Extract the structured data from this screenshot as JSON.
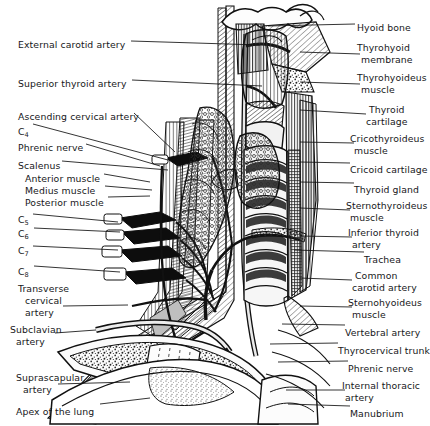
{
  "figure": {
    "style": "black-and-white engraved line art on white background",
    "background": "#ffffff",
    "ink": "#17171a"
  },
  "labels_left": [
    {
      "name": "external-carotid-artery",
      "text": "External carotid artery",
      "x": 18,
      "y": 39,
      "leader_to": [
        260,
        45
      ]
    },
    {
      "name": "superior-thyroid-artery",
      "text": "Superior thyroid artery",
      "x": 18,
      "y": 78,
      "leader_to": [
        262,
        86
      ]
    },
    {
      "name": "ascending-cervical-artery",
      "text": "Ascending cervical artery",
      "x": 18,
      "y": 111,
      "leader_to": [
        175,
        152
      ]
    },
    {
      "name": "c4-root",
      "text": "C",
      "sub": "4",
      "x": 18,
      "y": 126,
      "leader_to": [
        168,
        160
      ]
    },
    {
      "name": "phrenic-nerve-left",
      "text": "Phrenic nerve",
      "x": 18,
      "y": 142,
      "leader_to": [
        160,
        166
      ]
    },
    {
      "name": "scalenus",
      "text": "Scalenus",
      "x": 18,
      "y": 160,
      "leader_to": [
        168,
        170
      ]
    },
    {
      "name": "scalenus-anterior-muscle",
      "text": "Anterior muscle",
      "x": 25,
      "y": 173,
      "leader_to": [
        150,
        182
      ]
    },
    {
      "name": "scalenus-medius-muscle",
      "text": "Medius muscle",
      "x": 25,
      "y": 185,
      "leader_to": [
        152,
        190
      ]
    },
    {
      "name": "scalenus-posterior-muscle",
      "text": "Posterior muscle",
      "x": 25,
      "y": 197,
      "leader_to": [
        150,
        196
      ]
    },
    {
      "name": "c5-root",
      "text": "C",
      "sub": "5",
      "x": 18,
      "y": 214,
      "leader_to": [
        118,
        222
      ]
    },
    {
      "name": "c6-root",
      "text": "C",
      "sub": "6",
      "x": 18,
      "y": 228,
      "leader_to": [
        120,
        232
      ]
    },
    {
      "name": "c7-root",
      "text": "C",
      "sub": "7",
      "x": 18,
      "y": 245,
      "leader_to": [
        118,
        250
      ]
    },
    {
      "name": "c8-root",
      "text": "C",
      "sub": "8",
      "x": 18,
      "y": 266,
      "leader_to": [
        120,
        272
      ]
    },
    {
      "name": "transverse-cervical-artery",
      "text": "Transverse",
      "x": 18,
      "y": 283,
      "leader_to": null
    },
    {
      "name": "transverse-cervical-artery-l2",
      "text": "cervical",
      "x": 25,
      "y": 295,
      "leader_to": null
    },
    {
      "name": "transverse-cervical-artery-l3",
      "text": "artery",
      "x": 25,
      "y": 307,
      "leader_to": [
        128,
        305
      ]
    },
    {
      "name": "subclavian-artery",
      "text": "Subclavian",
      "x": 10,
      "y": 324,
      "leader_to": null
    },
    {
      "name": "subclavian-artery-l2",
      "text": "artery",
      "x": 16,
      "y": 336,
      "leader_to": [
        96,
        330
      ]
    },
    {
      "name": "suprascapular-artery",
      "text": "Suprascapular",
      "x": 16,
      "y": 372,
      "leader_to": null
    },
    {
      "name": "suprascapular-artery-l2",
      "text": "artery",
      "x": 23,
      "y": 384,
      "leader_to": [
        130,
        382
      ]
    },
    {
      "name": "apex-of-the-lung",
      "text": "Apex of the lung",
      "x": 16,
      "y": 406,
      "leader_to": [
        150,
        400
      ]
    }
  ],
  "labels_right": [
    {
      "name": "hyoid-bone",
      "text": "Hyoid bone",
      "x": 357,
      "y": 22,
      "leader_to": [
        268,
        26
      ]
    },
    {
      "name": "thyrohyoid-membrane",
      "text": "Thyrohyoid",
      "x": 357,
      "y": 42,
      "leader_to": null
    },
    {
      "name": "thyrohyoid-membrane-l2",
      "text": "membrane",
      "x": 361,
      "y": 54,
      "leader_to": [
        300,
        52
      ]
    },
    {
      "name": "thyrohyoideus-muscle",
      "text": "Thyrohyoideus",
      "x": 357,
      "y": 72,
      "leader_to": null
    },
    {
      "name": "thyrohyoideus-muscle-l2",
      "text": "muscle",
      "x": 361,
      "y": 84,
      "leader_to": [
        300,
        82
      ]
    },
    {
      "name": "thyroid-cartilage",
      "text": "Thyroid",
      "x": 369,
      "y": 104,
      "leader_to": null
    },
    {
      "name": "thyroid-cartilage-l2",
      "text": "cartilage",
      "x": 366,
      "y": 116,
      "leader_to": [
        300,
        110
      ]
    },
    {
      "name": "cricothyroideus-muscle",
      "text": "Cricothyroideus",
      "x": 350,
      "y": 133,
      "leader_to": null
    },
    {
      "name": "cricothyroideus-muscle-l2",
      "text": "muscle",
      "x": 354,
      "y": 145,
      "leader_to": [
        300,
        142
      ]
    },
    {
      "name": "cricoid-cartilage",
      "text": "Cricoid cartilage",
      "x": 350,
      "y": 164,
      "leader_to": [
        300,
        162
      ]
    },
    {
      "name": "thyroid-gland",
      "text": "Thyroid gland",
      "x": 354,
      "y": 184,
      "leader_to": [
        300,
        182
      ]
    },
    {
      "name": "sternothyroideus-muscle",
      "text": "Sternothyroideus",
      "x": 346,
      "y": 200,
      "leader_to": null
    },
    {
      "name": "sternothyroideus-muscle-l2",
      "text": "muscle",
      "x": 350,
      "y": 212,
      "leader_to": [
        300,
        208
      ]
    },
    {
      "name": "inferior-thyroid-artery",
      "text": "Inferior thyroid",
      "x": 348,
      "y": 227,
      "leader_to": null
    },
    {
      "name": "inferior-thyroid-artery-l2",
      "text": "artery",
      "x": 352,
      "y": 239,
      "leader_to": [
        300,
        236
      ]
    },
    {
      "name": "trachea",
      "text": "Trachea",
      "x": 364,
      "y": 254,
      "leader_to": [
        295,
        250
      ]
    },
    {
      "name": "common-carotid-artery",
      "text": "Common",
      "x": 355,
      "y": 270,
      "leader_to": null
    },
    {
      "name": "common-carotid-artery-l2",
      "text": "carotid artery",
      "x": 352,
      "y": 282,
      "leader_to": [
        300,
        278
      ]
    },
    {
      "name": "sternohyoideus-muscle",
      "text": "Sternohyoideus",
      "x": 348,
      "y": 297,
      "leader_to": null
    },
    {
      "name": "sternohyoideus-muscle-l2",
      "text": "muscle",
      "x": 352,
      "y": 309,
      "leader_to": [
        300,
        306
      ]
    },
    {
      "name": "vertebral-artery",
      "text": "Vertebral artery",
      "x": 345,
      "y": 327,
      "leader_to": [
        285,
        324
      ]
    },
    {
      "name": "thyrocervical-trunk",
      "text": "Thyrocervical trunk",
      "x": 338,
      "y": 345,
      "leader_to": [
        272,
        344
      ]
    },
    {
      "name": "phrenic-nerve-right",
      "text": "Phrenic nerve",
      "x": 348,
      "y": 363,
      "leader_to": [
        280,
        362
      ]
    },
    {
      "name": "internal-thoracic-artery",
      "text": "Internal thoracic",
      "x": 342,
      "y": 380,
      "leader_to": null
    },
    {
      "name": "internal-thoracic-artery-l2",
      "text": "artery",
      "x": 345,
      "y": 392,
      "leader_to": [
        288,
        390
      ]
    },
    {
      "name": "manubrium",
      "text": "Manubrium",
      "x": 350,
      "y": 408,
      "leader_to": [
        290,
        404
      ]
    }
  ]
}
